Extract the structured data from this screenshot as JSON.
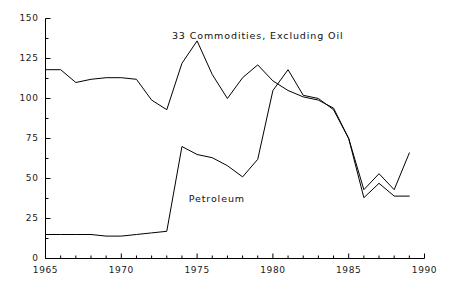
{
  "chart_data": {
    "type": "line",
    "title": "",
    "xlabel": "",
    "ylabel": "",
    "xlim": [
      1965,
      1990
    ],
    "ylim": [
      0,
      150
    ],
    "grid": false,
    "legend_position": "inline-annotation",
    "yticks": [
      0,
      25,
      50,
      75,
      100,
      125,
      150
    ],
    "ytick_labels": [
      "0",
      "25",
      "50",
      "75",
      "100",
      "125",
      "150"
    ],
    "yminor_step": 12.5,
    "xticks": [
      1965,
      1970,
      1975,
      1980,
      1985,
      1990
    ],
    "xtick_labels": [
      "1965",
      "1970",
      "1975",
      "1980",
      "1985",
      "1990"
    ],
    "xminor_step": 1,
    "axis_style": "left-and-bottom-only",
    "line_color": "#000000",
    "x": [
      1965,
      1966,
      1967,
      1968,
      1969,
      1970,
      1971,
      1972,
      1973,
      1974,
      1975,
      1976,
      1977,
      1978,
      1979,
      1980,
      1981,
      1982,
      1983,
      1984,
      1985,
      1986,
      1987,
      1988,
      1989
    ],
    "series": [
      {
        "name": "33 Commodities, Excluding Oil",
        "annotation": "33 Commodities, Excluding Oil",
        "annotation_x": 1979.0,
        "annotation_y": 139,
        "values": [
          118,
          118,
          110,
          112,
          113,
          113,
          112,
          99,
          93,
          122,
          136,
          115,
          100,
          113,
          121,
          111,
          105,
          101,
          99,
          94,
          75,
          43,
          53,
          43,
          66
        ]
      },
      {
        "name": "Petroleum",
        "annotation": "Petroleum",
        "annotation_x": 1976.3,
        "annotation_y": 37,
        "values": [
          15,
          15,
          15,
          15,
          14,
          14,
          15,
          16,
          17,
          70,
          65,
          63,
          58,
          51,
          62,
          105,
          118,
          102,
          100,
          93,
          75,
          38,
          47,
          39,
          39
        ]
      }
    ]
  },
  "annotations": {
    "commodities_label": "33 Commodities, Excluding Oil",
    "petroleum_label": "Petroleum"
  }
}
